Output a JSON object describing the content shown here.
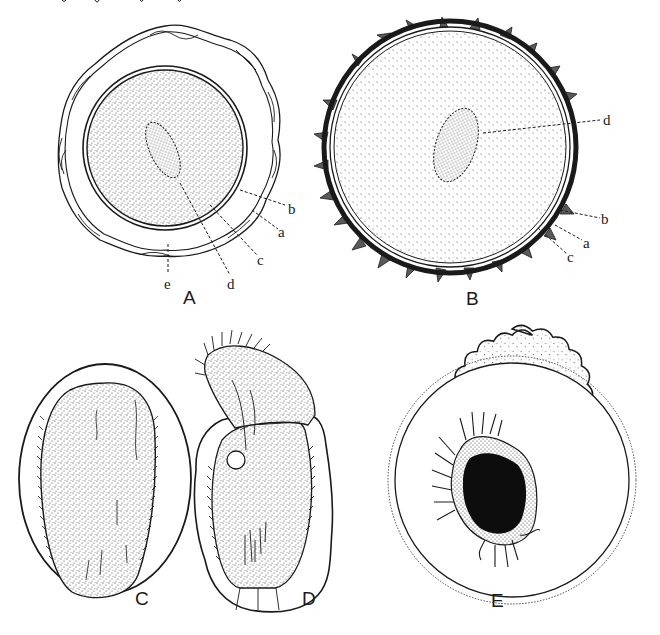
{
  "figure": {
    "colors": {
      "ink": "#1a1a1a",
      "paper": "#ffffff",
      "stipple": "#3a3a3a",
      "solid_mass": "#0d0d0d"
    },
    "panels": [
      {
        "id": "A",
        "label": "A",
        "description": "Round cyst with wavy outer envelope, double inner wall, stippled cytoplasm and oval nucleus",
        "callouts": [
          {
            "letter": "b"
          },
          {
            "letter": "a"
          },
          {
            "letter": "c"
          },
          {
            "letter": "d"
          },
          {
            "letter": "e"
          }
        ]
      },
      {
        "id": "B",
        "label": "B",
        "description": "Round cyst with spiny dark outer wall, thin inner wall, stippled contents and oval nucleus",
        "callouts": [
          {
            "letter": "d"
          },
          {
            "letter": "b"
          },
          {
            "letter": "a"
          },
          {
            "letter": "c"
          }
        ]
      },
      {
        "id": "C",
        "label": "C",
        "description": "Oval ciliate within an elliptical envelope, ciliated margins",
        "callouts": []
      },
      {
        "id": "D",
        "label": "D",
        "description": "Ciliate emerging from irregular envelope, ciliated anterior end and vacuole",
        "callouts": []
      },
      {
        "id": "E",
        "label": "E",
        "description": "Cyst with scalloped stippled outer wall containing a dark organism with radiating cilia",
        "callouts": []
      }
    ]
  }
}
